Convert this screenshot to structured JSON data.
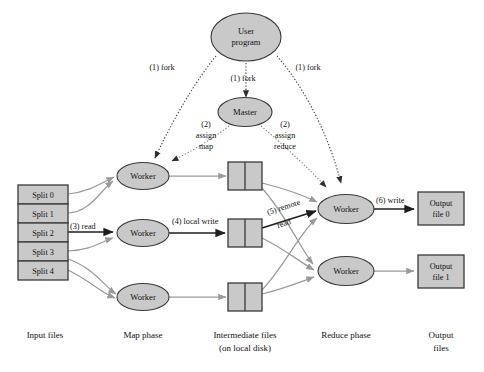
{
  "figure": {
    "background_color": "#ffffff",
    "node_fill": "#c9c9c9",
    "node_stroke": "#3a3a3a",
    "grey_arrow_color": "#9a9a9a",
    "dark_arrow_color": "#1e1e1e",
    "dotted_arrow_color": "#7d7d7d"
  },
  "nodes": {
    "user_program": {
      "line1": "User",
      "line2": "program"
    },
    "master": {
      "label": "Master"
    },
    "map_worker_1": {
      "label": "Worker"
    },
    "map_worker_2": {
      "label": "Worker"
    },
    "map_worker_3": {
      "label": "Worker"
    },
    "reduce_worker_1": {
      "label": "Worker"
    },
    "reduce_worker_2": {
      "label": "Worker"
    }
  },
  "input_files": {
    "splits": [
      {
        "label": "Split 0"
      },
      {
        "label": "Split 1"
      },
      {
        "label": "Split 2"
      },
      {
        "label": "Split 3"
      },
      {
        "label": "Split 4"
      }
    ]
  },
  "output_files": [
    {
      "line1": "Output",
      "line2": "file 0"
    },
    {
      "line1": "Output",
      "line2": "file 1"
    }
  ],
  "intermediate_files": {
    "count": 3,
    "partitions_per_file": 2
  },
  "steps": {
    "fork_left": "(1) fork",
    "fork_center": "(1) fork",
    "fork_right": "(1) fork",
    "assign_map_num": "(2)",
    "assign_map_l1": "assign",
    "assign_map_l2": "map",
    "assign_reduce_num": "(2)",
    "assign_reduce_l1": "assign",
    "assign_reduce_l2": "reduce",
    "read": "(3) read",
    "local_write": "(4) local write",
    "remote_read_l1": "(5) remote",
    "remote_read_l2": "read",
    "write": "(6) write"
  },
  "phase_labels": {
    "input": "Input files",
    "map": "Map phase",
    "intermediate_l1": "Intermediate files",
    "intermediate_l2": "(on local disk)",
    "reduce": "Reduce phase",
    "output_l1": "Output",
    "output_l2": "files"
  }
}
